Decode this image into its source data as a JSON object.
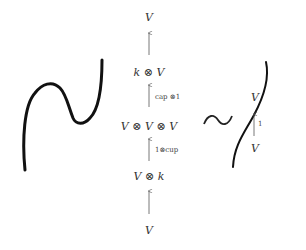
{
  "diagram": {
    "left_curve": {
      "description": "zigzag string diagram (cap and cup composite)"
    },
    "equivalence_symbol": "~",
    "right_curve": {
      "description": "straight identity string"
    },
    "center_chain": {
      "nodes": [
        "V",
        "k ⊗ V",
        "V ⊗ V ⊗ V",
        "V ⊗ k",
        "V"
      ],
      "arrows": [
        {
          "label": ""
        },
        {
          "label": "cap ⊗1"
        },
        {
          "label": "1⊗cup"
        },
        {
          "label": ""
        }
      ]
    },
    "right_chain": {
      "nodes": [
        "V",
        "V"
      ],
      "arrows": [
        {
          "label": "1"
        }
      ]
    }
  }
}
